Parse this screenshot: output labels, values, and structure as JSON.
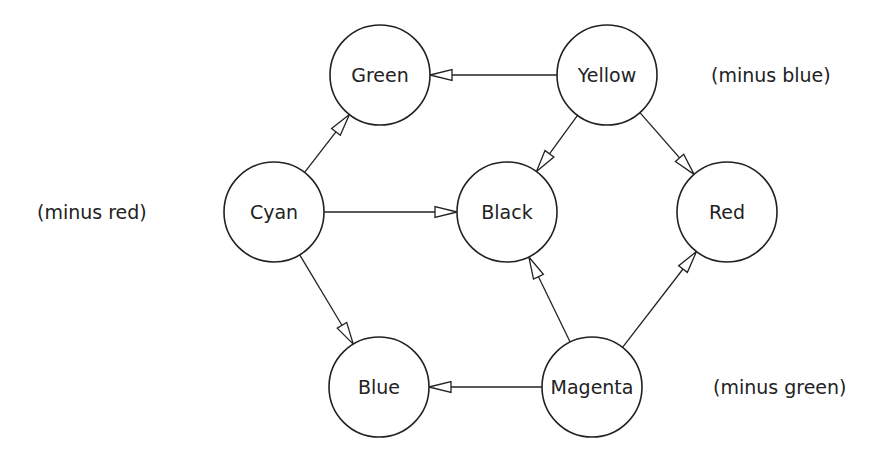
{
  "diagram": {
    "title": "",
    "node_radius": 50,
    "nodes": [
      {
        "id": "green",
        "label": "Green",
        "x": 380,
        "y": 75
      },
      {
        "id": "yellow",
        "label": "Yellow",
        "x": 607,
        "y": 75
      },
      {
        "id": "cyan",
        "label": "Cyan",
        "x": 274,
        "y": 212
      },
      {
        "id": "black",
        "label": "Black",
        "x": 507,
        "y": 212
      },
      {
        "id": "red",
        "label": "Red",
        "x": 727,
        "y": 212
      },
      {
        "id": "blue",
        "label": "Blue",
        "x": 379,
        "y": 387
      },
      {
        "id": "magenta",
        "label": "Magenta",
        "x": 592,
        "y": 387
      }
    ],
    "edges": [
      {
        "from": "yellow",
        "to": "green"
      },
      {
        "from": "yellow",
        "to": "black"
      },
      {
        "from": "yellow",
        "to": "red"
      },
      {
        "from": "cyan",
        "to": "green"
      },
      {
        "from": "cyan",
        "to": "black"
      },
      {
        "from": "cyan",
        "to": "blue"
      },
      {
        "from": "magenta",
        "to": "blue"
      },
      {
        "from": "magenta",
        "to": "black"
      },
      {
        "from": "magenta",
        "to": "red"
      }
    ],
    "annotations": [
      {
        "id": "minus-blue",
        "text": "(minus blue)",
        "x": 711,
        "y": 75
      },
      {
        "id": "minus-red",
        "text": "(minus red)",
        "x": 37,
        "y": 212
      },
      {
        "id": "minus-green",
        "text": "(minus green)",
        "x": 713,
        "y": 387
      }
    ],
    "colors": {
      "stroke": "#222222",
      "background": "#ffffff"
    }
  }
}
